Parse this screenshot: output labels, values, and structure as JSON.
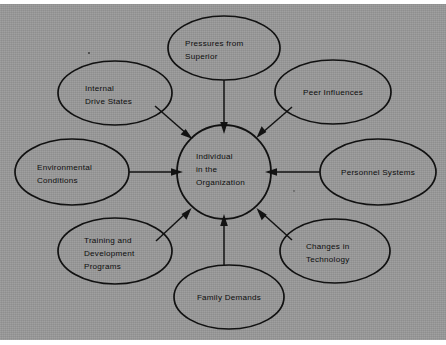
{
  "figure": {
    "kind": "radial-influence-diagram",
    "background_color": "#989898",
    "page_color": "#ffffff",
    "line_color": "#131313",
    "text_color": "#0d0d0d",
    "center": {
      "id": "individual-in-the-organization",
      "lines": [
        "Individual",
        "in the",
        "Organization"
      ],
      "shape": "circle"
    },
    "nodes": [
      {
        "id": "pressures-from-superior",
        "lines": [
          "Pressures from",
          "Superior"
        ],
        "shape": "ellipse",
        "position": "top"
      },
      {
        "id": "internal-drive-states",
        "lines": [
          "Internal",
          "Drive States"
        ],
        "shape": "ellipse",
        "position": "top-left"
      },
      {
        "id": "peer-influences",
        "lines": [
          "Peer Influences"
        ],
        "shape": "ellipse",
        "position": "top-right"
      },
      {
        "id": "environmental-conditions",
        "lines": [
          "Environmental",
          "Conditions"
        ],
        "shape": "ellipse",
        "position": "left"
      },
      {
        "id": "personnel-systems",
        "lines": [
          "Personnel Systems"
        ],
        "shape": "ellipse",
        "position": "right"
      },
      {
        "id": "training-and-development-programs",
        "lines": [
          "Training and",
          "Development",
          "Programs"
        ],
        "shape": "ellipse",
        "position": "bottom-left"
      },
      {
        "id": "changes-in-technology",
        "lines": [
          "Changes in",
          "Technology"
        ],
        "shape": "ellipse",
        "position": "bottom-right"
      },
      {
        "id": "family-demands",
        "lines": [
          "Family Demands"
        ],
        "shape": "ellipse",
        "position": "bottom"
      }
    ],
    "edges": [
      {
        "from": "pressures-from-superior",
        "to": "individual-in-the-organization",
        "arrow": "to"
      },
      {
        "from": "internal-drive-states",
        "to": "individual-in-the-organization",
        "arrow": "to"
      },
      {
        "from": "peer-influences",
        "to": "individual-in-the-organization",
        "arrow": "to"
      },
      {
        "from": "environmental-conditions",
        "to": "individual-in-the-organization",
        "arrow": "to"
      },
      {
        "from": "personnel-systems",
        "to": "individual-in-the-organization",
        "arrow": "to"
      },
      {
        "from": "training-and-development-programs",
        "to": "individual-in-the-organization",
        "arrow": "to"
      },
      {
        "from": "changes-in-technology",
        "to": "individual-in-the-organization",
        "arrow": "to"
      },
      {
        "from": "family-demands",
        "to": "individual-in-the-organization",
        "arrow": "to"
      }
    ]
  }
}
